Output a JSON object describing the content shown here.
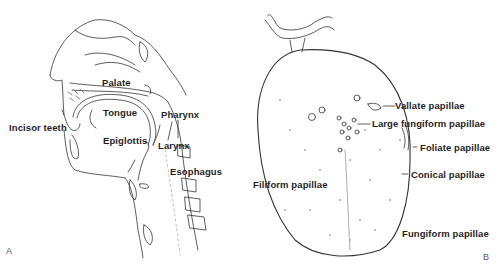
{
  "figure": {
    "panel_a": {
      "letter": "A",
      "description": "Sagittal section of head and neck",
      "labels": {
        "palate": "Palate",
        "tongue": "Tongue",
        "incisor_teeth": "Incisor teeth",
        "epiglottis": "Epiglottis",
        "pharynx": "Pharynx",
        "larynx": "Larynx",
        "esophagus": "Esophagus"
      }
    },
    "panel_b": {
      "letter": "B",
      "description": "Dorsal surface of the tongue",
      "labels": {
        "vallate": "Vallate papillae",
        "large_fungiform": "Large fungiform papillae",
        "foliate": "Foliate papillae",
        "conical": "Conical papillae",
        "filiform": "Filiform papillae",
        "fungiform": "Fungiform papillae"
      }
    },
    "colors": {
      "ink": "#1f1f1f",
      "background": "#ffffff"
    }
  }
}
